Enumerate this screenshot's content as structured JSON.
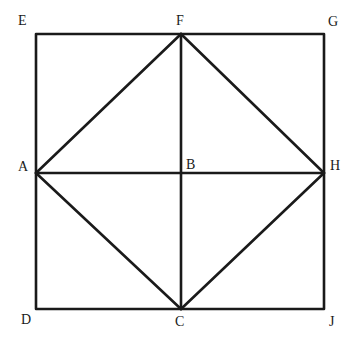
{
  "diagram": {
    "type": "geometry",
    "stroke_color": "#1a1a1a",
    "background": "#ffffff",
    "points": {
      "E": {
        "label": "E",
        "x": 36,
        "y": 34
      },
      "F": {
        "label": "F",
        "x": 181,
        "y": 34
      },
      "G": {
        "label": "G",
        "x": 324,
        "y": 34
      },
      "A": {
        "label": "A",
        "x": 36,
        "y": 173
      },
      "B": {
        "label": "B",
        "x": 181,
        "y": 173
      },
      "H": {
        "label": "H",
        "x": 324,
        "y": 173
      },
      "D": {
        "label": "D",
        "x": 36,
        "y": 309
      },
      "C": {
        "label": "C",
        "x": 181,
        "y": 309
      },
      "J": {
        "label": "J",
        "x": 324,
        "y": 309
      }
    },
    "segments": [
      [
        "E",
        "G"
      ],
      [
        "G",
        "J"
      ],
      [
        "J",
        "D"
      ],
      [
        "D",
        "E"
      ],
      [
        "A",
        "F"
      ],
      [
        "F",
        "H"
      ],
      [
        "H",
        "C"
      ],
      [
        "C",
        "A"
      ],
      [
        "A",
        "H"
      ],
      [
        "F",
        "C"
      ]
    ]
  }
}
